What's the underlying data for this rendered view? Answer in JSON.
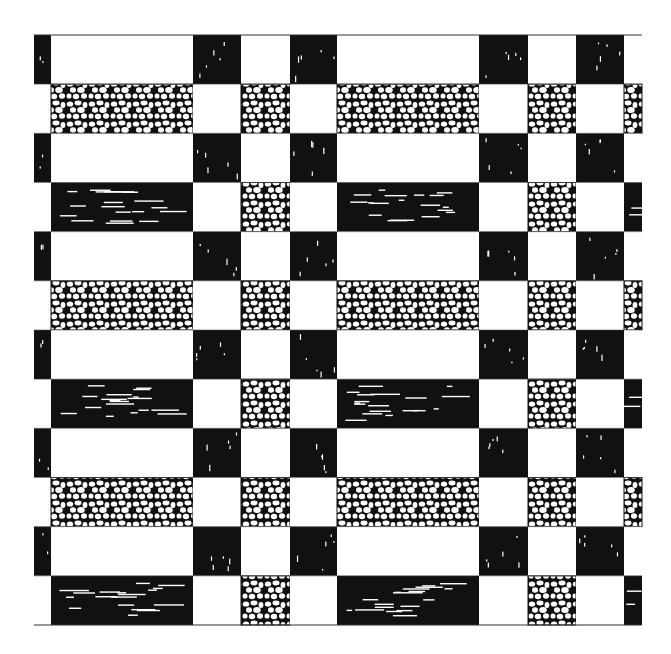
{
  "artwork": {
    "description": "Black-and-white woven checkerboard textile pattern with pebble and streak textures",
    "colors": {
      "black": "#111111",
      "white": "#ffffff",
      "line": "#333333"
    },
    "grid": {
      "left": 34,
      "top": 35,
      "right": 642,
      "bottom": 625,
      "rows": 12,
      "column_edges": [
        34,
        51,
        193,
        241,
        290,
        337,
        479,
        528,
        576,
        624,
        642
      ]
    },
    "row_types": [
      "A",
      "P",
      "A",
      "S",
      "A",
      "P",
      "A",
      "S",
      "A",
      "P",
      "A",
      "S"
    ],
    "row_patterns": {
      "A": [
        "b",
        "w",
        "b",
        "w",
        "b",
        "w",
        "b",
        "w",
        "b",
        "w"
      ],
      "P": [
        "w",
        "p",
        "w",
        "p",
        "w",
        "p",
        "w",
        "p",
        "w",
        "p"
      ],
      "S": [
        "w",
        "s",
        "w",
        "p",
        "w",
        "s",
        "w",
        "p",
        "w",
        "s"
      ]
    },
    "textures": {
      "b": "solid-black-with-white-flecks",
      "w": "plain-white",
      "p": "pebble-cells",
      "s": "black-with-horizontal-white-streaks"
    }
  }
}
